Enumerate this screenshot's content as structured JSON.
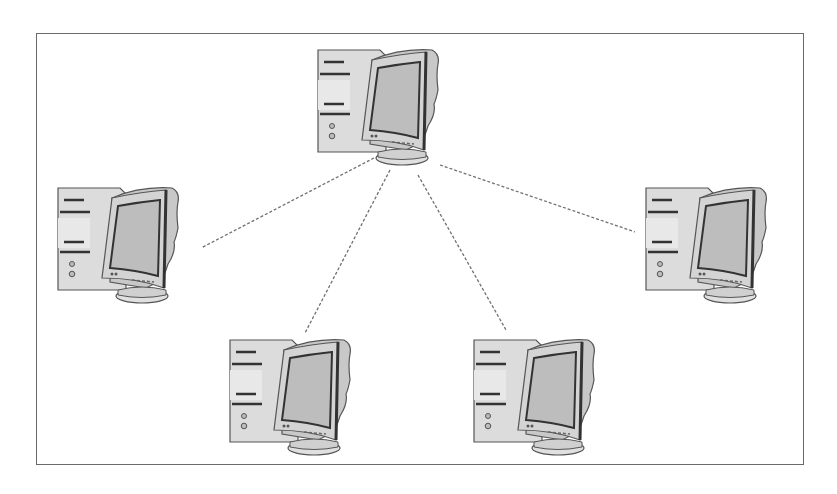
{
  "diagram": {
    "type": "star-network",
    "colors": {
      "border": "#6a6a6a",
      "link": "#707070",
      "case_fill": "#dcdcdc",
      "monitor_fill": "#c8c8c8",
      "screen_fill": "#bdbdbd",
      "outline": "#555555",
      "dark_stroke": "#333333"
    },
    "nodes": [
      {
        "id": "center",
        "role": "hub",
        "icon": "desktop-computer-icon",
        "x": 310,
        "y": 40
      },
      {
        "id": "left",
        "role": "peer",
        "icon": "desktop-computer-icon",
        "x": 50,
        "y": 178
      },
      {
        "id": "right",
        "role": "peer",
        "icon": "desktop-computer-icon",
        "x": 638,
        "y": 178
      },
      {
        "id": "bottom-left",
        "role": "peer",
        "icon": "desktop-computer-icon",
        "x": 222,
        "y": 330
      },
      {
        "id": "bottom-right",
        "role": "peer",
        "icon": "desktop-computer-icon",
        "x": 466,
        "y": 330
      }
    ],
    "links": [
      {
        "from": "center",
        "to": "left",
        "x1": 374,
        "y1": 158,
        "x2": 201,
        "y2": 248,
        "style": "dashed"
      },
      {
        "from": "center",
        "to": "bottom-left",
        "x1": 390,
        "y1": 170,
        "x2": 305,
        "y2": 333,
        "style": "dashed"
      },
      {
        "from": "center",
        "to": "bottom-right",
        "x1": 418,
        "y1": 175,
        "x2": 506,
        "y2": 330,
        "style": "dashed"
      },
      {
        "from": "center",
        "to": "right",
        "x1": 440,
        "y1": 165,
        "x2": 635,
        "y2": 232,
        "style": "dashed"
      }
    ]
  }
}
